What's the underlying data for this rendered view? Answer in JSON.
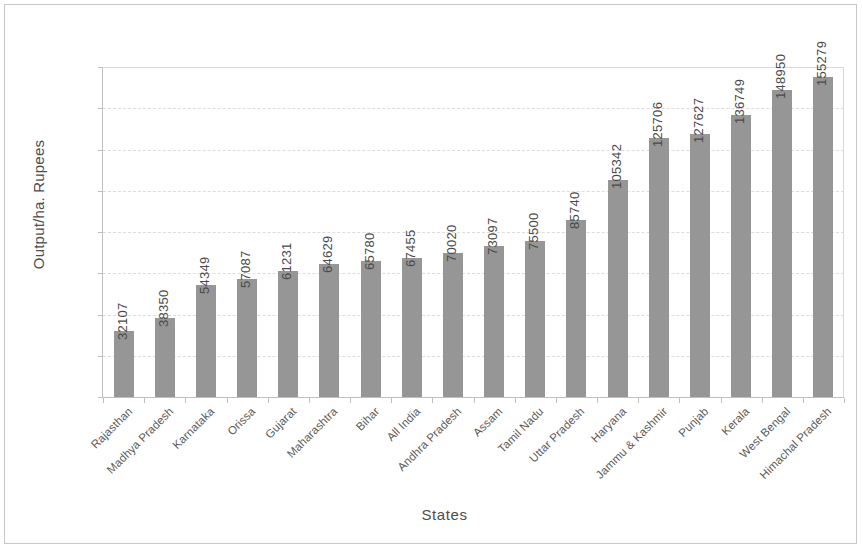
{
  "chart_data": {
    "type": "bar",
    "title": "",
    "xlabel": "States",
    "ylabel": "Output/ha. Rupees",
    "categories": [
      "Rajasthan",
      "Madhya Pradesh",
      "Karnataka",
      "Orissa",
      "Gujarat",
      "Maharashtra",
      "Bihar",
      "All India",
      "Andhra Pradesh",
      "Assam",
      "Tamil Nadu",
      "Uttar Pradesh",
      "Haryana",
      "Jammu & Kashmir",
      "Punjab",
      "Kerala",
      "West Bengal",
      "Himachal Pradesh"
    ],
    "values": [
      32107,
      38350,
      54349,
      57087,
      61231,
      64629,
      65780,
      67455,
      70020,
      73097,
      75500,
      85740,
      105342,
      125706,
      127627,
      136749,
      148950,
      155279
    ],
    "value_labels": [
      "32107",
      "38350",
      "54349",
      "57087",
      "61231",
      "64629",
      "65780",
      "67455",
      "70020",
      "73097",
      "75500",
      "85740",
      "105342",
      "125706",
      "127627",
      "136749",
      "148950",
      "155279"
    ],
    "ylim": [
      0,
      160000
    ],
    "y_ticks": [
      0,
      20000,
      40000,
      60000,
      80000,
      100000,
      120000,
      140000,
      160000
    ],
    "y_tick_labels": [
      "0",
      "20000",
      "40000",
      "60000",
      "80000",
      "100000",
      "120000",
      "140000",
      "160000"
    ],
    "grid": true,
    "legend": "none",
    "bar_color": "#969696",
    "gridline_color": "#dcdcdc",
    "axis_color": "#bfbfbf",
    "background_color": "#ffffff",
    "value_label_rotation": -90,
    "category_label_rotation": -45
  }
}
